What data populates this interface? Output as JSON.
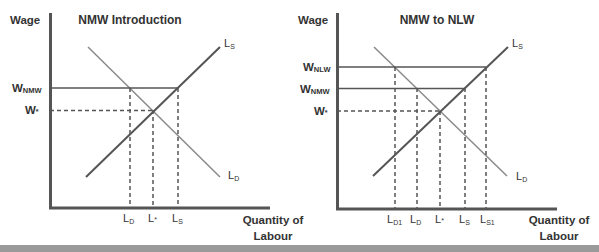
{
  "diagrams": [
    {
      "title": "NMW Introduction",
      "y_axis_label": "Wage",
      "x_axis_label_line1": "Quantity of",
      "x_axis_label_line2": "Labour",
      "curves": {
        "supply": {
          "main": "L",
          "sub": "S"
        },
        "demand": {
          "main": "L",
          "sub": "D"
        }
      },
      "wage_levels": [
        {
          "main": "W",
          "sub": "NMW"
        },
        {
          "main": "W",
          "sub": "*"
        }
      ],
      "quantity_labels": [
        {
          "main": "L",
          "sub": "D"
        },
        {
          "main": "L",
          "sub": "*"
        },
        {
          "main": "L",
          "sub": "S"
        }
      ]
    },
    {
      "title": "NMW to NLW",
      "y_axis_label": "Wage",
      "x_axis_label_line1": "Quantity of",
      "x_axis_label_line2": "Labour",
      "curves": {
        "supply": {
          "main": "L",
          "sub": "S"
        },
        "demand": {
          "main": "L",
          "sub": "D"
        }
      },
      "wage_levels": [
        {
          "main": "W",
          "sub": "NLW"
        },
        {
          "main": "W",
          "sub": "NMW"
        },
        {
          "main": "W",
          "sub": "*"
        }
      ],
      "quantity_labels": [
        {
          "main": "L",
          "sub": "D1"
        },
        {
          "main": "L",
          "sub": "D"
        },
        {
          "main": "L",
          "sub": "*"
        },
        {
          "main": "L",
          "sub": "S"
        },
        {
          "main": "L",
          "sub": "S1"
        }
      ]
    }
  ],
  "colors": {
    "axis": "#555555",
    "supply_line": "#555555",
    "demand_line": "#888888",
    "text": "#333333",
    "bottom_bar": "#9a9a9a"
  }
}
